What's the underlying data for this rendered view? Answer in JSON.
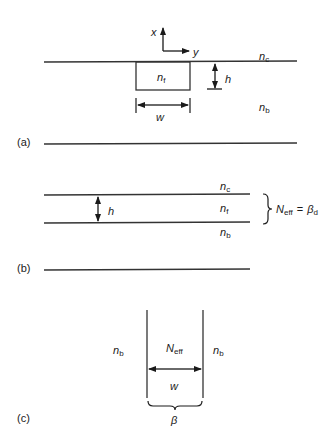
{
  "panels": {
    "a": {
      "label": "(a)",
      "axis_x": "x",
      "axis_y": "y",
      "n_cover": "n",
      "n_cover_sub": "c",
      "n_film": "n",
      "n_film_sub": "f",
      "n_sub": "n",
      "n_sub_sub": "b",
      "height": "h",
      "width": "w"
    },
    "b": {
      "label": "(b)",
      "n_cover": "n",
      "n_cover_sub": "c",
      "n_film": "n",
      "n_film_sub": "f",
      "n_sub": "n",
      "n_sub_sub": "b",
      "height": "h",
      "neff": "N",
      "neff_sub": "eff",
      "equals": "=",
      "beta": "β",
      "beta_sub": "d"
    },
    "c": {
      "label": "(c)",
      "n_left": "n",
      "n_left_sub": "b",
      "n_right": "n",
      "n_right_sub": "b",
      "neff": "N",
      "neff_sub": "eff",
      "width": "w",
      "beta": "β"
    }
  }
}
